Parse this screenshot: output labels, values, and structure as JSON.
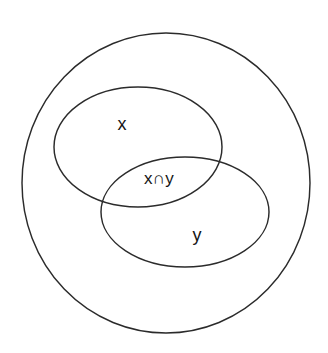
{
  "diagram": {
    "type": "venn",
    "background_color": "#ffffff",
    "stroke_color": "#2b2b2b",
    "text_color": "#151515",
    "canvas": {
      "width": 328,
      "height": 353
    },
    "shapes": {
      "universal_set": {
        "shape": "ellipse",
        "cx": 166,
        "cy": 183,
        "rx": 144,
        "ry": 150,
        "label": ""
      },
      "set_x": {
        "shape": "ellipse",
        "cx": 138,
        "cy": 147,
        "rx": 84,
        "ry": 60,
        "label": "x"
      },
      "set_y": {
        "shape": "ellipse",
        "cx": 185,
        "cy": 212,
        "rx": 84,
        "ry": 55,
        "label": "y"
      }
    },
    "labels": [
      {
        "id": "label-x",
        "text": "x",
        "x": 122,
        "y": 125
      },
      {
        "id": "label-x-intersect-y",
        "text": "x∩y",
        "x": 159,
        "y": 180
      },
      {
        "id": "label-y",
        "text": "y",
        "x": 197,
        "y": 236
      }
    ]
  }
}
